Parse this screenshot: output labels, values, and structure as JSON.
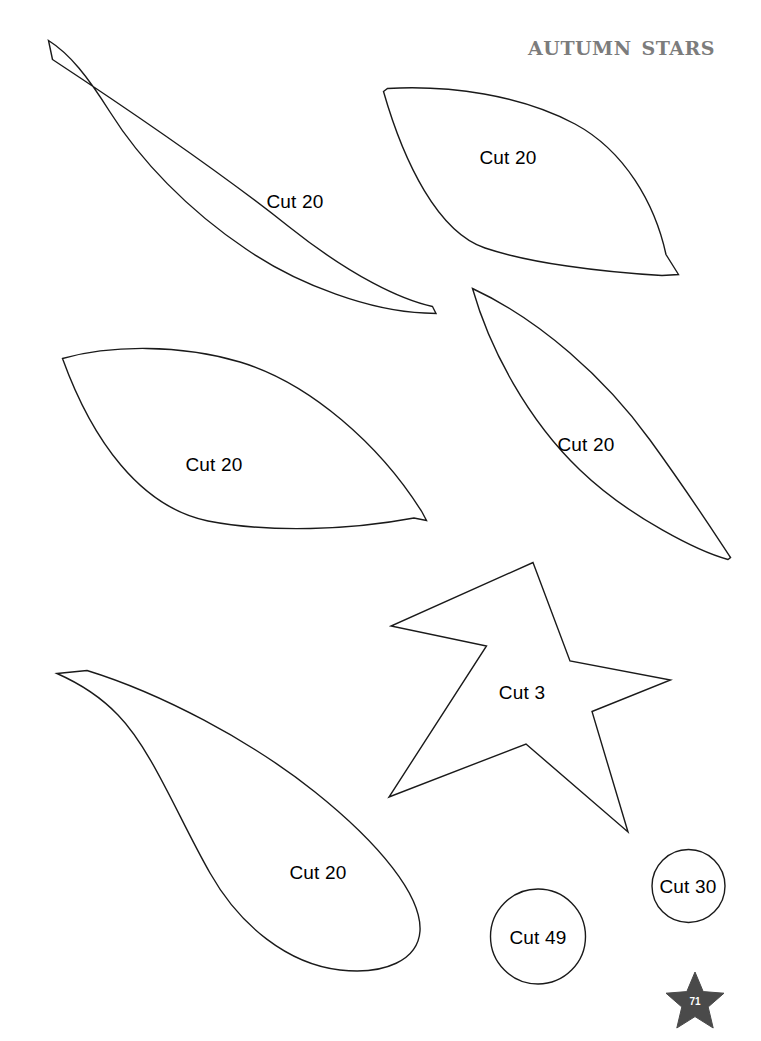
{
  "document": {
    "title": "Autumn Stars",
    "page_number": "71",
    "background_color": "#ffffff",
    "outline_color": "#1a1a1a",
    "title_color": "#7c7c7c",
    "badge_color": "#4a4a4a"
  },
  "pieces": [
    {
      "id": "leaf-large-top-left",
      "shape": "leaf",
      "label": "Cut 20",
      "label_x": 295,
      "label_y": 201
    },
    {
      "id": "leaf-top-right",
      "shape": "leaf",
      "label": "Cut 20",
      "label_x": 508,
      "label_y": 157
    },
    {
      "id": "leaf-middle-left",
      "shape": "leaf",
      "label": "Cut 20",
      "label_x": 214,
      "label_y": 464
    },
    {
      "id": "leaf-middle-right",
      "shape": "leaf",
      "label": "Cut 20",
      "label_x": 586,
      "label_y": 444
    },
    {
      "id": "star-center",
      "shape": "star",
      "label": "Cut 3",
      "label_x": 522,
      "label_y": 692
    },
    {
      "id": "leaf-teardrop-bottom-left",
      "shape": "teardrop",
      "label": "Cut 20",
      "label_x": 318,
      "label_y": 872
    },
    {
      "id": "circle-large",
      "shape": "circle",
      "label": "Cut 49",
      "label_x": 538,
      "label_y": 937
    },
    {
      "id": "circle-small",
      "shape": "circle",
      "label": "Cut 30",
      "label_x": 688,
      "label_y": 886
    }
  ]
}
